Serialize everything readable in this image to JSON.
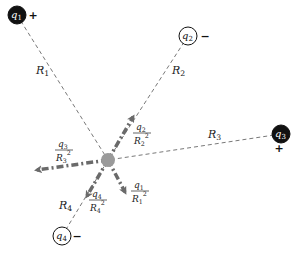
{
  "diagram": {
    "colors": {
      "positive_charge_fill": "#111111",
      "negative_charge_fill": "#ffffff",
      "test_point_fill": "#9a9a9a",
      "arrow_color": "#6a6a6a",
      "line_color": "#555555"
    },
    "test_point": {
      "x": 108,
      "y": 160,
      "r": 7
    },
    "charges": [
      {
        "id": "q1",
        "name": "q",
        "sub": "1",
        "sign": "+",
        "x": 17,
        "y": 15,
        "fill": "dark",
        "sign_x": 33,
        "sign_y": 19
      },
      {
        "id": "q2",
        "name": "q",
        "sub": "2",
        "sign": "−",
        "x": 188,
        "y": 36,
        "fill": "light",
        "sign_x": 205,
        "sign_y": 40
      },
      {
        "id": "q3",
        "name": "q",
        "sub": "3",
        "sign": "+",
        "x": 281,
        "y": 134,
        "fill": "dark",
        "sign_x": 279,
        "sign_y": 152
      },
      {
        "id": "q4",
        "name": "q",
        "sub": "4",
        "sign": "−",
        "x": 62,
        "y": 236,
        "fill": "light",
        "sign_x": 77,
        "sign_y": 240
      }
    ],
    "distances": [
      {
        "name": "R",
        "sub": "1",
        "x": 36,
        "y": 74
      },
      {
        "name": "R",
        "sub": "2",
        "x": 172,
        "y": 74
      },
      {
        "name": "R",
        "sub": "3",
        "x": 208,
        "y": 138
      },
      {
        "name": "R",
        "sub": "4",
        "x": 59,
        "y": 209
      }
    ],
    "field_vectors": [
      {
        "id": "E1",
        "to_x": 125,
        "to_y": 192,
        "num": "q",
        "num_sub": "1",
        "den": "R",
        "den_sub": "1",
        "label_x": 132,
        "label_y": 188
      },
      {
        "id": "E2",
        "to_x": 133,
        "to_y": 117,
        "num": "q",
        "num_sub": "2",
        "den": "R",
        "den_sub": "2",
        "label_x": 134,
        "label_y": 130
      },
      {
        "id": "E3",
        "to_x": 37,
        "to_y": 170,
        "num": "q",
        "num_sub": "3",
        "den": "R",
        "den_sub": "3",
        "label_x": 56,
        "label_y": 147
      },
      {
        "id": "E4",
        "to_x": 87,
        "to_y": 196,
        "num": "q",
        "num_sub": "4",
        "den": "R",
        "den_sub": "4",
        "label_x": 90,
        "label_y": 197
      }
    ],
    "superscript": "2"
  }
}
